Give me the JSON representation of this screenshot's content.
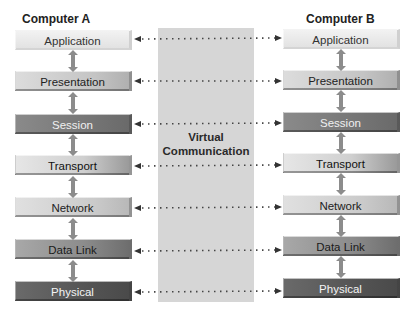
{
  "left": {
    "title": "Computer A",
    "layers": [
      "Application",
      "Presentation",
      "Session",
      "Transport",
      "Network",
      "Data Link",
      "Physical"
    ]
  },
  "right": {
    "title": "Computer B",
    "layers": [
      "Application",
      "Presentation",
      "Session",
      "Transport",
      "Network",
      "Data Link",
      "Physical"
    ]
  },
  "center": {
    "label_line1": "Virtual",
    "label_line2": "Communication"
  },
  "colors": {
    "panel": "#d6d6d6",
    "arrow": "#333333",
    "vertical_arrow": "#8c8c8c"
  }
}
